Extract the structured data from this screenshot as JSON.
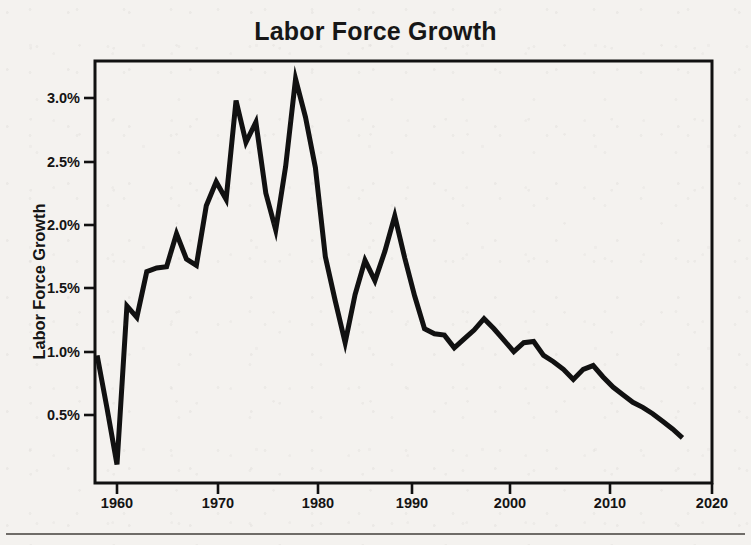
{
  "figure": {
    "title": "Labor Force Growth",
    "bottom_rule": true
  },
  "axes": {
    "y_axis_title": "Labor Force Growth",
    "y_tick_labels": [
      "0.5%",
      "1.0%",
      "1.5%",
      "2.0%",
      "2.5%",
      "3.0%"
    ],
    "x_tick_labels": [
      "1960",
      "1970",
      "1980",
      "1990",
      "2000",
      "2010",
      "2020"
    ]
  },
  "chart_data": {
    "type": "line",
    "title": "Labor Force Growth",
    "xlabel": "",
    "ylabel": "Labor Force Growth",
    "xlim": [
      1956.5,
      2020
    ],
    "ylim": [
      0.0,
      3.35
    ],
    "grid": false,
    "legend": "none",
    "line_color": "#111111",
    "line_width_px": 5,
    "x_ticks": [
      1960,
      1970,
      1980,
      1990,
      2000,
      2010,
      2020
    ],
    "y_ticks": [
      0.5,
      1.0,
      1.5,
      2.0,
      2.5,
      3.0
    ],
    "y_tick_format": "percent",
    "x": [
      1958,
      1959,
      1960,
      1961,
      1962,
      1963,
      1964,
      1965,
      1966,
      1967,
      1968,
      1969,
      1970,
      1971,
      1972,
      1973,
      1974,
      1975,
      1976,
      1977,
      1978,
      1979,
      1980,
      1981,
      1982,
      1983,
      1984,
      1985,
      1986,
      1987,
      1988,
      1989,
      1990,
      1991,
      1992,
      1993,
      1994,
      1995,
      1996,
      1997,
      1998,
      1999,
      2000,
      2001,
      2002,
      2003,
      2004,
      2005,
      2006,
      2007,
      2008,
      2009,
      2010,
      2011,
      2012,
      2013,
      2014,
      2015,
      2016,
      2017
    ],
    "values": [
      0.97,
      0.55,
      0.11,
      1.36,
      1.27,
      1.63,
      1.66,
      1.67,
      1.93,
      1.73,
      1.68,
      2.15,
      2.34,
      2.2,
      2.98,
      2.65,
      2.81,
      2.25,
      1.96,
      2.46,
      3.15,
      2.85,
      2.45,
      1.75,
      1.4,
      1.07,
      1.45,
      1.72,
      1.56,
      1.79,
      2.07,
      1.74,
      1.44,
      1.18,
      1.14,
      1.13,
      1.03,
      1.1,
      1.17,
      1.26,
      1.18,
      1.09,
      1.0,
      1.07,
      1.08,
      0.97,
      0.92,
      0.86,
      0.78,
      0.86,
      0.89,
      0.8,
      0.72,
      0.66,
      0.6,
      0.56,
      0.51,
      0.45,
      0.39,
      0.32
    ],
    "units": "percent annual growth"
  },
  "geometry": {
    "plot_left_px": 95,
    "plot_right_px": 712,
    "plot_top_px": 61,
    "plot_bottom_px": 483,
    "x_at_1960_px": 117,
    "px_per_decade": 99.2,
    "y_at_0p5_px": 415,
    "px_per_half_percent": 63.4
  }
}
